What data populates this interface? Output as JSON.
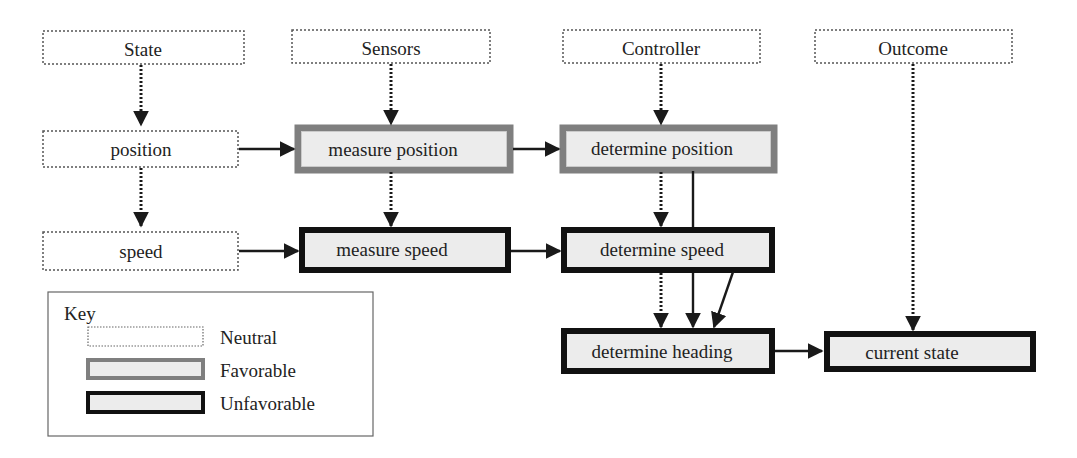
{
  "diagram": {
    "columns": [
      {
        "id": "state",
        "label": "State"
      },
      {
        "id": "sensors",
        "label": "Sensors"
      },
      {
        "id": "controller",
        "label": "Controller"
      },
      {
        "id": "outcome",
        "label": "Outcome"
      }
    ],
    "nodes": {
      "position": {
        "label": "position",
        "style": "neutral"
      },
      "speed": {
        "label": "speed",
        "style": "neutral"
      },
      "measure_position": {
        "label": "measure position",
        "style": "favorable"
      },
      "measure_speed": {
        "label": "measure speed",
        "style": "unfavorable"
      },
      "determine_position": {
        "label": "determine position",
        "style": "favorable"
      },
      "determine_speed": {
        "label": "determine speed",
        "style": "unfavorable"
      },
      "determine_heading": {
        "label": "determine heading",
        "style": "unfavorable"
      },
      "current_state": {
        "label": "current state",
        "style": "unfavorable"
      }
    },
    "edges": [
      {
        "from": "State",
        "to": "position",
        "type": "dotted"
      },
      {
        "from": "position",
        "to": "speed",
        "type": "dotted"
      },
      {
        "from": "Sensors",
        "to": "measure position",
        "type": "dotted"
      },
      {
        "from": "measure position",
        "to": "measure speed",
        "type": "dotted"
      },
      {
        "from": "Controller",
        "to": "determine position",
        "type": "dotted"
      },
      {
        "from": "determine position",
        "to": "determine speed",
        "type": "dotted"
      },
      {
        "from": "determine position",
        "to": "determine heading",
        "type": "solid"
      },
      {
        "from": "determine speed",
        "to": "determine heading",
        "type": "dotted"
      },
      {
        "from": "determine speed",
        "to": "determine heading",
        "type": "solid-diagonal"
      },
      {
        "from": "Outcome",
        "to": "current state",
        "type": "dotted"
      },
      {
        "from": "position",
        "to": "measure position",
        "type": "solid"
      },
      {
        "from": "measure position",
        "to": "determine position",
        "type": "solid"
      },
      {
        "from": "speed",
        "to": "measure speed",
        "type": "solid"
      },
      {
        "from": "measure speed",
        "to": "determine speed",
        "type": "solid"
      },
      {
        "from": "determine heading",
        "to": "current state",
        "type": "solid"
      }
    ],
    "key": {
      "title": "Key",
      "items": [
        {
          "label": "Neutral",
          "style": "neutral"
        },
        {
          "label": "Favorable",
          "style": "favorable"
        },
        {
          "label": "Unfavorable",
          "style": "unfavorable"
        }
      ]
    },
    "colors": {
      "neutral_border": "#555555",
      "favorable_border": "#808080",
      "unfavorable_border": "#111111",
      "fill": "#ececec",
      "arrow": "#1a1a1a"
    }
  }
}
